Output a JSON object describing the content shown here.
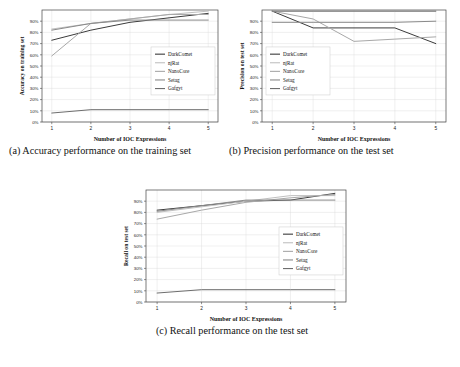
{
  "figure": {
    "background": "#ffffff",
    "axis_color": "#444444",
    "grid_color": "#d8d8d8",
    "series_colors": {
      "DarkComet": "#3b3b3b",
      "njRat": "#c0c0c0",
      "NanoCore": "#a8a8a8",
      "Setag": "#8a8a8a",
      "Gafgyt": "#6e6e6e"
    }
  },
  "panels": [
    {
      "id": "a",
      "caption": "(a) Accuracy performance on the training set",
      "legend_position": "center-right"
    },
    {
      "id": "b",
      "caption": "(b) Precision performance on the test set",
      "legend_position": "center-left"
    },
    {
      "id": "c",
      "caption": "(c) Recall performance on the test set",
      "legend_position": "center-right"
    }
  ],
  "chart_data": [
    {
      "type": "line",
      "panel": "a",
      "title": "",
      "xlabel": "Number of IOC Expressions",
      "ylabel": "Accuracy on training set",
      "x": [
        1,
        2,
        3,
        4,
        5
      ],
      "xticklabels": [
        "1",
        "2",
        "3",
        "4",
        "5"
      ],
      "yticklabels": [
        "0%",
        "10%",
        "20%",
        "30%",
        "40%",
        "50%",
        "60%",
        "70%",
        "80%",
        "90%"
      ],
      "ytickvalues": [
        0,
        10,
        20,
        30,
        40,
        50,
        60,
        70,
        80,
        90
      ],
      "ylim": [
        0,
        100
      ],
      "xlim": [
        0.75,
        5.25
      ],
      "grid": true,
      "legend": [
        "DarkComet",
        "njRat",
        "NanoCore",
        "Setag",
        "Gafgyt"
      ],
      "series": [
        {
          "name": "DarkComet",
          "values": [
            73,
            82,
            89,
            93,
            97
          ]
        },
        {
          "name": "njRat",
          "values": [
            83,
            88,
            92,
            96,
            99
          ]
        },
        {
          "name": "NanoCore",
          "values": [
            59,
            88,
            92,
            96,
            96
          ]
        },
        {
          "name": "Setag",
          "values": [
            82,
            88,
            91,
            91,
            91
          ]
        },
        {
          "name": "Gafgyt",
          "values": [
            8,
            11,
            11,
            11,
            11
          ]
        }
      ]
    },
    {
      "type": "line",
      "panel": "b",
      "title": "",
      "xlabel": "Number of IOC Expressions",
      "ylabel": "Precision on test set",
      "x": [
        1,
        2,
        3,
        4,
        5
      ],
      "xticklabels": [
        "1",
        "2",
        "3",
        "4",
        "5"
      ],
      "yticklabels": [
        "0%",
        "10%",
        "20%",
        "30%",
        "40%",
        "50%",
        "60%",
        "70%",
        "80%",
        "90%"
      ],
      "ytickvalues": [
        0,
        10,
        20,
        30,
        40,
        50,
        60,
        70,
        80,
        90
      ],
      "ylim": [
        0,
        100
      ],
      "xlim": [
        0.75,
        5.25
      ],
      "grid": true,
      "legend": [
        "DarkComet",
        "njRat",
        "NanoCore",
        "Setag",
        "Gafgyt"
      ],
      "series": [
        {
          "name": "DarkComet",
          "values": [
            99,
            84,
            84,
            84,
            70
          ]
        },
        {
          "name": "njRat",
          "values": [
            99,
            99,
            99,
            99,
            99
          ]
        },
        {
          "name": "NanoCore",
          "values": [
            99,
            92,
            72,
            74,
            76
          ]
        },
        {
          "name": "Setag",
          "values": [
            89,
            89,
            89,
            89,
            90
          ]
        },
        {
          "name": "Gafgyt",
          "values": [
            99,
            99,
            99,
            99,
            99
          ]
        }
      ]
    },
    {
      "type": "line",
      "panel": "c",
      "title": "",
      "xlabel": "Number of IOC Expressions",
      "ylabel": "Recall on test set",
      "x": [
        1,
        2,
        3,
        4,
        5
      ],
      "xticklabels": [
        "1",
        "2",
        "3",
        "4",
        "5"
      ],
      "yticklabels": [
        "0%",
        "10%",
        "20%",
        "30%",
        "40%",
        "50%",
        "60%",
        "70%",
        "80%",
        "90%"
      ],
      "ytickvalues": [
        0,
        10,
        20,
        30,
        40,
        50,
        60,
        70,
        80,
        90
      ],
      "ylim": [
        0,
        100
      ],
      "xlim": [
        0.75,
        5.25
      ],
      "grid": true,
      "legend": [
        "DarkComet",
        "njRat",
        "NanoCore",
        "Setag",
        "Gafgyt"
      ],
      "series": [
        {
          "name": "DarkComet",
          "values": [
            82,
            86,
            90,
            91,
            97
          ]
        },
        {
          "name": "njRat",
          "values": [
            80,
            85,
            90,
            95,
            95
          ]
        },
        {
          "name": "NanoCore",
          "values": [
            74,
            82,
            89,
            93,
            96
          ]
        },
        {
          "name": "Setag",
          "values": [
            81,
            86,
            91,
            91,
            91
          ]
        },
        {
          "name": "Gafgyt",
          "values": [
            8,
            11,
            11,
            11,
            11
          ]
        }
      ]
    }
  ]
}
